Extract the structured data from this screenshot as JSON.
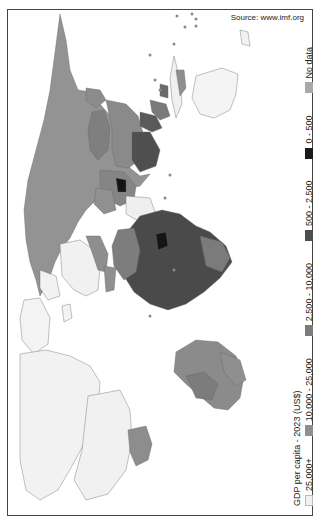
{
  "source": "Source: www.imf.org",
  "legend": {
    "title": "GDP per capita - 2023 (US$)",
    "items": [
      {
        "label": "25,000+",
        "color": "#f2f2f2",
        "border": "#bbbbbb"
      },
      {
        "label": "10,000 - 25,000",
        "color": "#8f8f8f",
        "border": "#8f8f8f"
      },
      {
        "label": "2,500 - 10,000",
        "color": "#7b7b7b",
        "border": "#7b7b7b"
      },
      {
        "label": "500 - 2,500",
        "color": "#4d4d4d",
        "border": "#4d4d4d"
      },
      {
        "label": "0 - 500",
        "color": "#1a1a1a",
        "border": "#1a1a1a"
      },
      {
        "label": "No data",
        "color": "#a8a8a8",
        "border": "#a8a8a8"
      }
    ]
  },
  "map": {
    "orientation": "rotated 90deg clockwise (north to the right)",
    "colors": {
      "high": "#f2f2f2",
      "upper_middle": "#8f8f8f",
      "middle": "#7b7b7b",
      "lower_middle": "#4d4d4d",
      "low": "#1a1a1a",
      "no_data": "#a8a8a8",
      "ocean": "#ffffff",
      "border": "#666666"
    }
  }
}
